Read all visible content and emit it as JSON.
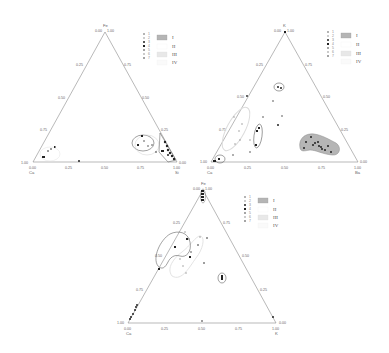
{
  "figure": {
    "colors": {
      "axis": "#8a8a8a",
      "point": "#222222",
      "field_I_fill": "#b5b5b5",
      "field_I_stroke": "#8a8a8a",
      "field_II_stroke": "#444444",
      "field_III_fill": "#e8e8e8",
      "field_III_stroke": "#c8c8c8",
      "field_IV_stroke": "#dddddd"
    }
  },
  "legend": {
    "point_types": [
      "1",
      "2",
      "3",
      "4",
      "5",
      "6",
      "7"
    ],
    "fields": [
      "I",
      "II",
      "III",
      "IV"
    ]
  },
  "diagrams": [
    {
      "id": "fe-ca-si",
      "vertices": {
        "top": "Fe",
        "left": "Ca",
        "right": "Si"
      },
      "top_labels": [
        "0.00",
        "1.00"
      ],
      "left_edge_ticks": [
        "0.25",
        "0.50",
        "0.75",
        "1.00"
      ],
      "right_edge_ticks": [
        "0.75",
        "0.50",
        "0.25",
        "0.00"
      ],
      "bottom_ticks": [
        "0.00",
        "0.25",
        "0.50",
        "0.75",
        "1.00"
      ]
    },
    {
      "id": "k-ca-ba",
      "vertices": {
        "top": "K",
        "left": "Ca",
        "right": "Ba"
      },
      "top_labels": [
        "0.00",
        "1.00"
      ],
      "left_edge_ticks": [
        "0.25",
        "0.50",
        "0.75",
        "1.00"
      ],
      "right_edge_ticks": [
        "0.75",
        "0.50",
        "0.25",
        "0.00"
      ],
      "bottom_ticks": [
        "0.00",
        "0.25",
        "0.50",
        "0.75",
        "1.00"
      ]
    },
    {
      "id": "fe-ca-k",
      "vertices": {
        "top": "Fe",
        "left": "Ca",
        "right": "K"
      },
      "top_labels": [
        "0.00",
        "1.00"
      ],
      "left_edge_ticks": [
        "0.25",
        "0.50",
        "0.75",
        "1.00"
      ],
      "right_edge_ticks": [
        "0.75",
        "0.50",
        "0.25",
        "0.00"
      ],
      "bottom_ticks": [
        "0.00",
        "0.25",
        "0.50",
        "0.75",
        "1.00"
      ]
    }
  ]
}
